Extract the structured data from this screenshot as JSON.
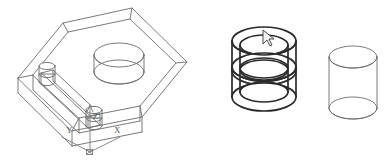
{
  "scene": {
    "title": "AutoCAD 3D wireframe viewport",
    "background_color": "#ffffff",
    "line_color": "#6b6b6b",
    "bold_line_color": "#2a2a2a",
    "ucs_label_color": "#5a5a5a"
  },
  "ucs_icon": {
    "name": "UCS axis icon",
    "x_label": "X",
    "y_label": "Y",
    "z_label": "Z",
    "origin": {
      "x": 90,
      "y": 152
    }
  },
  "objects": [
    {
      "id": "box-solid",
      "label": "Isometric rectangular block with pocket",
      "type": "box",
      "style": "wireframe",
      "features": [
        "two overlapping cylindrical holes",
        "rail slot with two pins"
      ]
    },
    {
      "id": "double-cylinder",
      "label": "Selected overlapping cylinder pair",
      "type": "cylinder-pair",
      "style": "wireframe-bold",
      "selected": true
    },
    {
      "id": "single-cylinder",
      "label": "Cylinder",
      "type": "cylinder",
      "style": "wireframe",
      "selected": false
    }
  ],
  "cursor": {
    "name": "crosshair-pickbox-cursor",
    "x": 266,
    "y": 36
  }
}
